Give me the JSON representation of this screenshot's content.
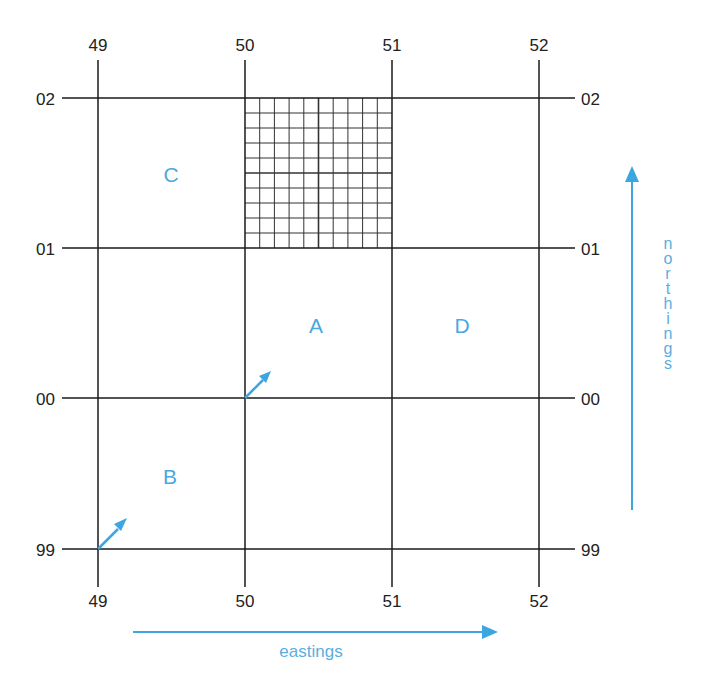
{
  "diagram": {
    "title_fragment": "",
    "colors": {
      "grid_line": "#1a1a1a",
      "accent_blue": "#3da6e0",
      "label_text": "#222222"
    },
    "eastings": {
      "top_labels": [
        "49",
        "50",
        "51",
        "52"
      ],
      "bottom_labels": [
        "49",
        "50",
        "51",
        "52"
      ],
      "axis_label": "eastings"
    },
    "northings": {
      "left_labels": [
        "02",
        "01",
        "00",
        "99"
      ],
      "right_labels": [
        "02",
        "01",
        "00",
        "99"
      ],
      "axis_label": "northings",
      "axis_letters": [
        "n",
        "o",
        "r",
        "t",
        "h",
        "i",
        "n",
        "g",
        "s"
      ]
    },
    "squares": {
      "A": "A",
      "B": "B",
      "C": "C",
      "D": "D"
    },
    "subdivided_square": {
      "easting_from": "50",
      "easting_to": "51",
      "northing_from": "01",
      "northing_to": "02",
      "divisions": 10
    },
    "icons": {
      "northings_arrow": "arrow-up-icon",
      "eastings_arrow": "arrow-right-icon",
      "square_a_reference_arrow": "arrow-diagonal-ne-icon",
      "square_b_reference_arrow": "arrow-diagonal-ne-icon"
    }
  }
}
